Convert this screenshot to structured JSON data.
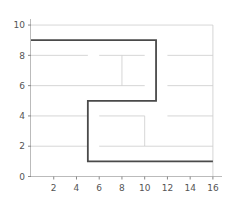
{
  "chart_data": {
    "type": "line",
    "title": "",
    "xlabel": "",
    "ylabel": "",
    "xlim": [
      0,
      16.8
    ],
    "ylim": [
      0,
      10.4
    ],
    "grid": false,
    "legend": "none",
    "xticks": [
      2,
      4,
      6,
      8,
      10,
      12,
      14,
      16
    ],
    "yticks": [
      0,
      2,
      4,
      6,
      8,
      10
    ],
    "xtick_labels": [
      "2",
      "4",
      "6",
      "8",
      "10",
      "12",
      "14",
      "16"
    ],
    "ytick_labels": [
      "0",
      "2",
      "4",
      "6",
      "8",
      "10"
    ],
    "series": [
      {
        "name": "solution-path",
        "color": "#4a4a4a",
        "linewidth": 1.8,
        "points": [
          [
            0,
            9
          ],
          [
            11,
            9
          ],
          [
            11,
            5
          ],
          [
            5,
            5
          ],
          [
            5,
            1
          ],
          [
            16,
            1
          ]
        ]
      }
    ],
    "maze_walls": {
      "name": "maze-walls",
      "color": "#cccccc",
      "linewidth": 0.8,
      "segments": [
        [
          [
            0,
            8
          ],
          [
            5,
            8
          ]
        ],
        [
          [
            6,
            8
          ],
          [
            8,
            8
          ]
        ],
        [
          [
            8,
            8
          ],
          [
            10,
            8
          ]
        ],
        [
          [
            12,
            8
          ],
          [
            16,
            8
          ]
        ],
        [
          [
            8,
            6
          ],
          [
            8,
            8
          ]
        ],
        [
          [
            0,
            6
          ],
          [
            8,
            6
          ]
        ],
        [
          [
            8,
            6
          ],
          [
            10,
            6
          ]
        ],
        [
          [
            12,
            6
          ],
          [
            16,
            6
          ]
        ],
        [
          [
            0,
            4
          ],
          [
            5,
            4
          ]
        ],
        [
          [
            6,
            4
          ],
          [
            10,
            4
          ]
        ],
        [
          [
            12,
            4
          ],
          [
            16,
            4
          ]
        ],
        [
          [
            10,
            2
          ],
          [
            10,
            4
          ]
        ],
        [
          [
            0,
            2
          ],
          [
            5,
            2
          ]
        ],
        [
          [
            6,
            2
          ],
          [
            10,
            2
          ]
        ],
        [
          [
            10,
            2
          ],
          [
            16,
            2
          ]
        ],
        [
          [
            0,
            10
          ],
          [
            16,
            10
          ]
        ],
        [
          [
            16,
            0
          ],
          [
            16,
            10
          ]
        ]
      ]
    }
  },
  "axes": {
    "spine_color": "#bbbbbb",
    "tick_color": "#888888",
    "label_color": "#555555"
  },
  "path_color": "#4a4a4a",
  "wall_color": "#cccccc"
}
